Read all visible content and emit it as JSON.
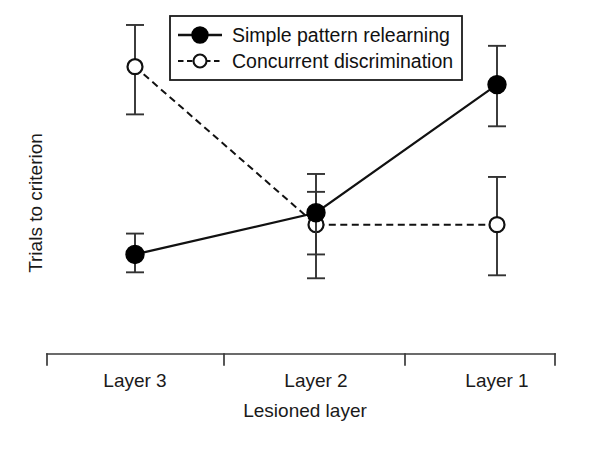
{
  "chart_data": {
    "type": "line",
    "title": "",
    "subtitle": "",
    "xlabel": "Lesioned layer",
    "ylabel": "Trials to criterion",
    "categories": [
      "Layer 3",
      "Layer 2",
      "Layer 1"
    ],
    "grid": false,
    "axis": {
      "x_axis_style": "bracket-with-interior-ticks",
      "x_tick_labels": [
        "Layer 3",
        "Layer 2",
        "Layer 1"
      ],
      "y_axis_visible": false,
      "y_tick_labels": [],
      "ylim": [
        0,
        100
      ],
      "y_units": "arbitrary (unlabeled)"
    },
    "legend": {
      "position": "top-center",
      "boxed": true,
      "entries": [
        {
          "label": "Simple pattern relearning",
          "marker": "filled-circle",
          "line": "solid",
          "color": "#000000"
        },
        {
          "label": "Concurrent discrimination",
          "marker": "open-circle",
          "line": "dashed",
          "color": "#000000"
        }
      ]
    },
    "series": [
      {
        "name": "Simple pattern relearning",
        "marker": "filled-circle",
        "line": "solid",
        "color": "#000000",
        "values": [
          22,
          36,
          79
        ],
        "err_low": [
          16,
          22,
          65
        ],
        "err_high": [
          29,
          49,
          92
        ]
      },
      {
        "name": "Concurrent discrimination",
        "marker": "open-circle",
        "line": "dashed",
        "color": "#000000",
        "values": [
          85,
          32,
          32
        ],
        "err_low": [
          69,
          14,
          15
        ],
        "err_high": [
          99,
          43,
          48
        ]
      }
    ]
  },
  "layout": {
    "plot_left": 47,
    "plot_right": 555,
    "plot_top": 16,
    "plot_bottom": 354,
    "category_x": [
      135,
      316,
      497
    ],
    "interior_tick_x": [
      224,
      405
    ],
    "y_value_top": 22,
    "y_value_bottom": 320,
    "legend_box": {
      "x": 170,
      "y": 16,
      "w": 292,
      "h": 64
    },
    "marker_radius": 9,
    "line_color": "#111111",
    "error_bar_color": "#333333"
  },
  "colors": {
    "background": "#ffffff",
    "ink": "#1a1a1a",
    "series_filled": "#000000",
    "series_open_fill": "#ffffff",
    "series_open_stroke": "#111111"
  }
}
